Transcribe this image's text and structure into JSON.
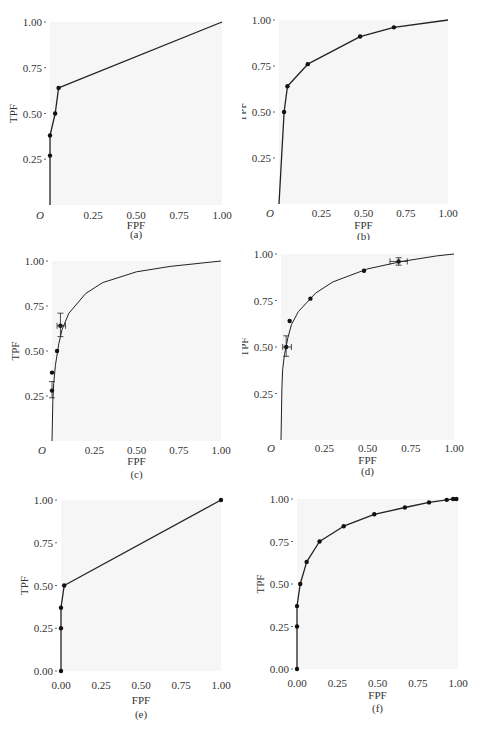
{
  "figure": {
    "panels": [
      {
        "id": "a",
        "caption": "(a)",
        "xlabel": "FPF",
        "ylabel": "TPF",
        "origin_label": "O",
        "xticks": [
          "0.25",
          "0.50",
          "0.75",
          "1.00"
        ],
        "yticks": [
          "0.25",
          "0.50",
          "0.75",
          "1.00"
        ]
      },
      {
        "id": "b",
        "caption": "(b)",
        "xlabel": "FPF",
        "ylabel": "TPF",
        "origin_label": "O",
        "xticks": [
          "0.25",
          "0.50",
          "0.75",
          "1.00"
        ],
        "yticks": [
          "0.25",
          "0.50",
          "0.75",
          "1.00"
        ]
      },
      {
        "id": "c",
        "caption": "(c)",
        "xlabel": "FPF",
        "ylabel": "TPF",
        "origin_label": "O",
        "xticks": [
          "0.25",
          "0.50",
          "0.75",
          "1.00"
        ],
        "yticks": [
          "0.25",
          "0.50",
          "0.75",
          "1.00"
        ]
      },
      {
        "id": "d",
        "caption": "(d)",
        "xlabel": "FPF",
        "ylabel": "TPF",
        "origin_label": "O",
        "xticks": [
          "0.25",
          "0.50",
          "0.75",
          "1.00"
        ],
        "yticks": [
          "0.25",
          "0.50",
          "0.75",
          "1.00"
        ]
      },
      {
        "id": "e",
        "caption": "(e)",
        "xlabel": "FPF",
        "ylabel": "TPF",
        "origin_label": "",
        "xticks": [
          "0.00",
          "0.25",
          "0.50",
          "0.75",
          "1.00"
        ],
        "yticks": [
          "0.00",
          "0.25",
          "0.50",
          "0.75",
          "1.00"
        ]
      },
      {
        "id": "f",
        "caption": "(f)",
        "xlabel": "FPF",
        "ylabel": "TPF",
        "origin_label": "",
        "xticks": [
          "0.00",
          "0.25",
          "0.50",
          "0.75",
          "1.00"
        ],
        "yticks": [
          "0.00",
          "0.25",
          "0.50",
          "0.75",
          "1.00"
        ]
      }
    ]
  },
  "chart_data": [
    {
      "panel": "a",
      "type": "line",
      "title": "",
      "xlabel": "FPF",
      "ylabel": "TPF",
      "xlim": [
        0,
        1
      ],
      "ylim": [
        0,
        1
      ],
      "grid": false,
      "series": [
        {
          "name": "empirical ROC",
          "x": [
            0.0,
            0.0,
            0.0,
            0.03,
            0.05,
            1.0
          ],
          "y": [
            0.0,
            0.27,
            0.38,
            0.5,
            0.64,
            1.0
          ],
          "markers": [
            [
              0.0,
              0.27
            ],
            [
              0.0,
              0.38
            ],
            [
              0.03,
              0.5
            ],
            [
              0.05,
              0.64
            ]
          ]
        }
      ]
    },
    {
      "panel": "b",
      "type": "line",
      "title": "",
      "xlabel": "FPF",
      "ylabel": "TPF",
      "xlim": [
        0,
        1
      ],
      "ylim": [
        0,
        1
      ],
      "grid": false,
      "series": [
        {
          "name": "empirical ROC",
          "x": [
            0.0,
            0.03,
            0.05,
            0.17,
            0.48,
            0.68,
            1.0
          ],
          "y": [
            0.0,
            0.5,
            0.64,
            0.76,
            0.91,
            0.96,
            1.0
          ],
          "markers": [
            [
              0.03,
              0.5
            ],
            [
              0.05,
              0.64
            ],
            [
              0.17,
              0.76
            ],
            [
              0.48,
              0.91
            ],
            [
              0.68,
              0.96
            ]
          ]
        }
      ]
    },
    {
      "panel": "c",
      "type": "line",
      "title": "",
      "xlabel": "FPF",
      "ylabel": "TPF",
      "xlim": [
        0,
        1
      ],
      "ylim": [
        0,
        1
      ],
      "grid": false,
      "series": [
        {
          "name": "fitted smooth ROC",
          "x": [
            0,
            0.005,
            0.01,
            0.02,
            0.04,
            0.06,
            0.1,
            0.2,
            0.3,
            0.5,
            0.7,
            0.9,
            1.0
          ],
          "y": [
            0,
            0.22,
            0.32,
            0.42,
            0.54,
            0.62,
            0.71,
            0.82,
            0.88,
            0.94,
            0.97,
            0.99,
            1.0
          ]
        },
        {
          "name": "observed points",
          "x": [
            0.0,
            0.0,
            0.03,
            0.05
          ],
          "y": [
            0.28,
            0.38,
            0.5,
            0.64
          ]
        }
      ],
      "error_bars": [
        {
          "x": 0.0,
          "y": 0.28,
          "y_low": 0.24,
          "y_high": 0.33
        },
        {
          "x": 0.05,
          "y": 0.64,
          "y_low": 0.58,
          "y_high": 0.71,
          "x_low": 0.03,
          "x_high": 0.08
        }
      ]
    },
    {
      "panel": "d",
      "type": "line",
      "title": "",
      "xlabel": "FPF",
      "ylabel": "TPF",
      "xlim": [
        0,
        1
      ],
      "ylim": [
        0,
        1
      ],
      "grid": false,
      "series": [
        {
          "name": "fitted smooth ROC",
          "x": [
            0,
            0.005,
            0.01,
            0.02,
            0.04,
            0.06,
            0.1,
            0.2,
            0.3,
            0.5,
            0.7,
            0.9,
            1.0
          ],
          "y": [
            0,
            0.28,
            0.38,
            0.46,
            0.55,
            0.62,
            0.69,
            0.79,
            0.85,
            0.92,
            0.96,
            0.99,
            1.0
          ]
        },
        {
          "name": "observed points",
          "x": [
            0.03,
            0.05,
            0.17,
            0.48,
            0.68
          ],
          "y": [
            0.5,
            0.64,
            0.76,
            0.91,
            0.96
          ]
        }
      ],
      "error_bars": [
        {
          "x": 0.03,
          "y": 0.5,
          "y_low": 0.45,
          "y_high": 0.56,
          "x_low": 0.01,
          "x_high": 0.06
        },
        {
          "x": 0.68,
          "y": 0.96,
          "y_low": 0.94,
          "y_high": 0.98,
          "x_low": 0.63,
          "x_high": 0.73
        }
      ]
    },
    {
      "panel": "e",
      "type": "line",
      "title": "",
      "xlabel": "FPF",
      "ylabel": "TPF",
      "xlim": [
        0,
        1
      ],
      "ylim": [
        0,
        1
      ],
      "grid": false,
      "series": [
        {
          "name": "empirical ROC",
          "x": [
            0.0,
            0.0,
            0.0,
            0.02,
            1.0
          ],
          "y": [
            0.0,
            0.25,
            0.37,
            0.5,
            1.0
          ]
        }
      ]
    },
    {
      "panel": "f",
      "type": "line",
      "title": "",
      "xlabel": "FPF",
      "ylabel": "TPF",
      "xlim": [
        0,
        1
      ],
      "ylim": [
        0,
        1
      ],
      "grid": false,
      "series": [
        {
          "name": "empirical ROC",
          "x": [
            0.0,
            0.0,
            0.0,
            0.02,
            0.06,
            0.14,
            0.29,
            0.48,
            0.67,
            0.82,
            0.93,
            0.97,
            0.99
          ],
          "y": [
            0.0,
            0.25,
            0.37,
            0.5,
            0.63,
            0.75,
            0.84,
            0.91,
            0.95,
            0.98,
            0.995,
            1.0,
            1.0
          ]
        }
      ]
    }
  ]
}
